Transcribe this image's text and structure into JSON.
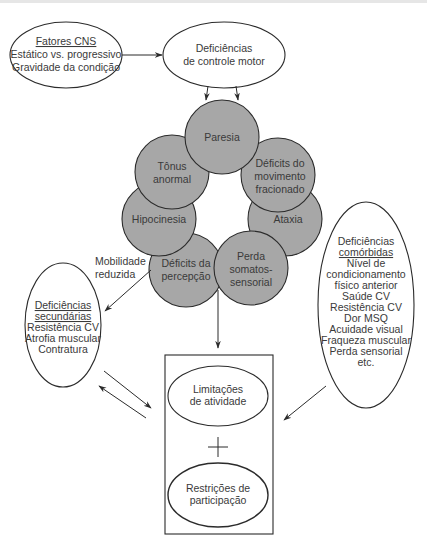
{
  "nodes": {
    "cns_factors": {
      "title": "Fatores CNS",
      "lines": [
        "Estático vs. progressivo",
        "Gravidade da condição"
      ]
    },
    "motor_control": {
      "lines": [
        "Deficiências",
        "de controle motor"
      ]
    },
    "impairments_ring": [
      {
        "id": "paresia",
        "lines": [
          "Paresia"
        ]
      },
      {
        "id": "deficits_movimento",
        "lines": [
          "Déficits do",
          "movimento",
          "fracionado"
        ]
      },
      {
        "id": "ataxia",
        "lines": [
          "Ataxia"
        ]
      },
      {
        "id": "perda_somatossensorial",
        "lines": [
          "Perda",
          "somatos-",
          "sensorial"
        ]
      },
      {
        "id": "deficits_percepcao",
        "lines": [
          "Déficits da",
          "percepção"
        ]
      },
      {
        "id": "hipocinesia",
        "lines": [
          "Hipocinesia"
        ]
      },
      {
        "id": "tonus",
        "lines": [
          "Tônus",
          "anormal"
        ]
      }
    ],
    "secondary": {
      "title_lines": [
        "Deficiências",
        "secundárias"
      ],
      "lines": [
        "Resistência CV",
        "Atrofia muscular",
        "Contratura"
      ]
    },
    "comorbid": {
      "title_lines": [
        "Deficiências",
        "comórbidas"
      ],
      "lines": [
        "Nível de",
        "condicionamento",
        "físico anterior",
        "Saúde CV",
        "Resistência CV",
        "Dor MSQ",
        "Acuidade visual",
        "Fraqueza muscular",
        "Perda sensorial",
        "etc."
      ]
    },
    "activity": {
      "lines": [
        "Limitações",
        "de atividade"
      ]
    },
    "plus": "+",
    "participation": {
      "lines": [
        "Restrições de",
        "participação"
      ]
    }
  },
  "edge_labels": {
    "reduced_mobility": [
      "Mobilidade",
      "reduzida"
    ]
  },
  "colors": {
    "circle_fill": "#a7a7a7",
    "stroke": "#2b2b2b",
    "text": "#3a3a3a"
  }
}
